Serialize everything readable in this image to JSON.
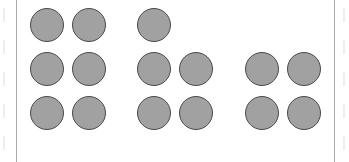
{
  "diagram": {
    "type": "counting-groups",
    "colors": {
      "circle_fill": "#a1a1a1",
      "circle_stroke": "#4a4a4a",
      "frame": "#aaaaaa"
    },
    "groups": [
      {
        "name": "group-1",
        "count": 6,
        "circles": [
          [
            47,
            25
          ],
          [
            89,
            25
          ],
          [
            47,
            69
          ],
          [
            89,
            69
          ],
          [
            47,
            113
          ],
          [
            89,
            113
          ]
        ]
      },
      {
        "name": "group-2",
        "count": 5,
        "circles": [
          [
            154,
            25
          ],
          [
            154,
            69
          ],
          [
            196,
            69
          ],
          [
            154,
            113
          ],
          [
            196,
            113
          ]
        ]
      },
      {
        "name": "group-3",
        "count": 4,
        "circles": [
          [
            262,
            69
          ],
          [
            304,
            69
          ],
          [
            262,
            113
          ],
          [
            304,
            113
          ]
        ]
      }
    ]
  }
}
